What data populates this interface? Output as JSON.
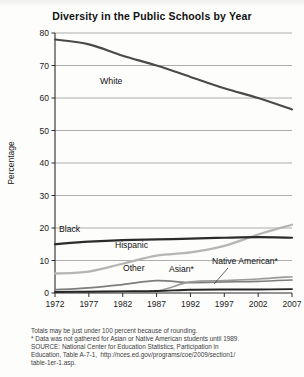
{
  "chart_title": "Diversity in the Public Schools by Year",
  "axes": {
    "ylabel": "Percentage",
    "xlabel": "Year",
    "yticks": [
      0,
      10,
      20,
      30,
      40,
      50,
      60,
      70,
      80
    ],
    "xticks": [
      1972,
      1977,
      1982,
      1987,
      1992,
      1997,
      2002,
      2007
    ],
    "ylim": [
      0,
      80
    ],
    "xlim": [
      1972,
      2007
    ],
    "grid": "horizontal"
  },
  "series_labels": {
    "white": "White",
    "black": "Black",
    "hispanic": "Hispanic",
    "other": "Other",
    "asian": "Asian*",
    "native": "Native American*"
  },
  "footnotes": [
    "Totals may be just under 100 percent because of rounding.",
    "* Data was not gathered for Asian or Native American students until 1989.",
    "SOURCE: National Center for Education Statistics, Participation in",
    "Education, Table A-7-1,  http://nces.ed.gov/programs/coe/2009/section1/",
    "table-1er-1.asp."
  ],
  "colors": {
    "white_line": "#4a4a4a",
    "black_line": "#2b2b2b",
    "hispanic_line": "#b5b5b5",
    "other_line": "#7d7d7d",
    "asian_line": "#9a9a9a",
    "native_line": "#262626",
    "grid": "#8a8a8a",
    "axis": "#2b2b2b",
    "text": "#1b1b1b"
  },
  "chart_data": {
    "type": "line",
    "title": "Diversity in the Public Schools by Year",
    "xlabel": "Year",
    "ylabel": "Percentage",
    "xlim": [
      1972,
      2007
    ],
    "ylim": [
      0,
      80
    ],
    "grid": true,
    "legend": "inline-labels",
    "x": [
      1972,
      1977,
      1982,
      1987,
      1992,
      1997,
      2002,
      2007
    ],
    "series": [
      {
        "name": "White",
        "values": [
          78,
          76.5,
          73,
          70,
          66.5,
          63,
          60,
          56.5
        ]
      },
      {
        "name": "Black",
        "values": [
          15,
          15.8,
          16.3,
          16.5,
          16.7,
          17,
          17.2,
          17
        ]
      },
      {
        "name": "Hispanic",
        "values": [
          6,
          6.6,
          9,
          11.5,
          12.5,
          14.5,
          18,
          21
        ]
      },
      {
        "name": "Other",
        "values": [
          1,
          1.6,
          2.6,
          3.8,
          3.2,
          3.4,
          3.6,
          4
        ]
      },
      {
        "name": "Asian*",
        "values": [
          0.3,
          0.4,
          0.5,
          0.6,
          3.4,
          3.8,
          4.3,
          5
        ]
      },
      {
        "name": "Native American*",
        "values": [
          0.3,
          0.4,
          0.5,
          0.6,
          1.0,
          1.1,
          1.1,
          1.2
        ]
      }
    ],
    "annotations": [
      "Totals may be just under 100 percent because of rounding.",
      "* Data was not gathered for Asian or Native American students until 1989."
    ]
  }
}
